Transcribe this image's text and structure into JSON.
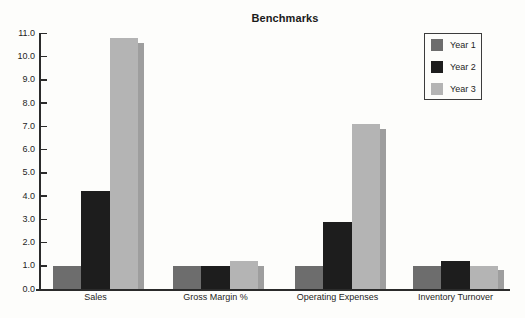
{
  "chart_data": {
    "type": "bar",
    "title": "Benchmarks",
    "categories": [
      "Sales",
      "Gross Margin %",
      "Operating Expenses",
      "Inventory Turnover"
    ],
    "series": [
      {
        "name": "Year 1",
        "color": "#6d6d6d",
        "values": [
          1.0,
          1.0,
          1.0,
          1.0
        ]
      },
      {
        "name": "Year 2",
        "color": "#1d1d1d",
        "values": [
          4.2,
          1.0,
          2.9,
          1.2
        ]
      },
      {
        "name": "Year 3",
        "color": "#b4b4b4",
        "values": [
          10.8,
          1.2,
          7.1,
          1.0
        ]
      }
    ],
    "ylim": [
      0.0,
      11.0
    ],
    "ytick_step": 1.0,
    "ytick_labels": [
      "0.0",
      "1.0",
      "2.0",
      "3.0",
      "4.0",
      "5.0",
      "6.0",
      "7.0",
      "8.0",
      "9.0",
      "10.0",
      "11.0"
    ],
    "xlabel": "",
    "ylabel": "",
    "grid": false,
    "legend_position": "top-right",
    "legend_border": true,
    "bar_shadow": true,
    "shadow_color": "#9e9e9e",
    "axis_color": "#2b2b2b",
    "background_color": "#fdfdfb"
  }
}
